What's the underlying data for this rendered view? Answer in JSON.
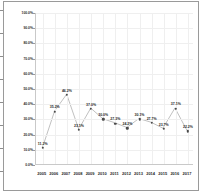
{
  "chart_data": {
    "type": "line",
    "title": "",
    "xlabel": "",
    "ylabel": "",
    "ylim": [
      0,
      100
    ],
    "grid": true,
    "legend": "none",
    "categories": [
      "2005",
      "2006",
      "2007",
      "2008",
      "2009",
      "2010",
      "2011",
      "2012",
      "2013",
      "2014",
      "2015",
      "2016",
      "2017"
    ],
    "values": [
      11.2,
      35.2,
      46.2,
      23.1,
      37.0,
      30.0,
      27.3,
      24.2,
      30.1,
      27.7,
      23.7,
      37.1,
      22.2
    ],
    "point_labels": [
      "11.2%",
      "35.2%",
      "46.2%",
      "23.1%",
      "37.0%",
      "30.0%",
      "27.3%",
      "24.2%",
      "30.1%",
      "27.7%",
      "23.7%",
      "37.1%",
      "22.2%"
    ],
    "ytick_labels": [
      "100.0%",
      "90.0%",
      "80.0%",
      "70.0%",
      "60.0%",
      "50.0%",
      "40.0%",
      "30.0%",
      "20.0%",
      "10.0%",
      "0.0%"
    ],
    "ytick_values": [
      100,
      90,
      80,
      70,
      60,
      50,
      40,
      30,
      20,
      10,
      0
    ],
    "series": [
      {
        "name": "series-1",
        "values": [
          11.2,
          35.2,
          46.2,
          23.1,
          37.0,
          30.0,
          27.3,
          24.2,
          30.1,
          27.7,
          23.7,
          37.1,
          22.2
        ]
      }
    ],
    "colors": {
      "line": "#b8b8b8",
      "marker": "#4a4a4a",
      "grid": "#efefef",
      "axis": "#c9c9c9",
      "text": "#1f1f1f",
      "frame": "#9a9a9a",
      "background": "#ffffff"
    }
  }
}
